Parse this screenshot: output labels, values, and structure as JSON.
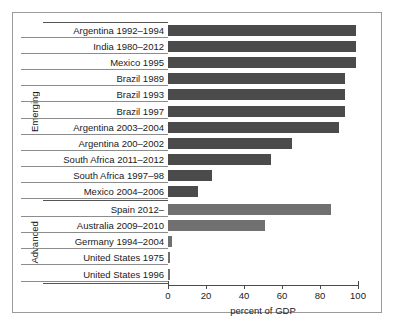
{
  "chart_data": {
    "type": "bar",
    "orientation": "horizontal",
    "title": "",
    "xlabel": "percent of GDP",
    "ylabel": "",
    "xlim": [
      0,
      100
    ],
    "xticks": [
      0,
      20,
      40,
      60,
      80,
      100
    ],
    "xtick_labels": [
      "0",
      "20",
      "40",
      "60",
      "80",
      "100"
    ],
    "grid": false,
    "legend": "none",
    "groups": [
      {
        "name": "Emerging",
        "color": "#4b4b4b",
        "categories": [
          "Argentina 1992–1994",
          "India 1980–2012",
          "Mexico 1995",
          "Brazil 1989",
          "Brazil 1993",
          "Brazil 1997",
          "Argentina 2003–2004",
          "Argentina 200–2002",
          "South Africa 2011–2012",
          "South Africa 1997–98",
          "Mexico 2004–2006"
        ],
        "values": [
          99,
          99,
          99,
          93,
          93,
          93,
          90,
          65,
          54,
          23,
          16
        ]
      },
      {
        "name": "Advanced",
        "color": "#707070",
        "categories": [
          "Spain 2012–",
          "Australia 2009–2010",
          "Germany 1994–2004",
          "United States 1975",
          "United States 1996"
        ],
        "values": [
          86,
          51,
          2,
          1,
          1
        ]
      }
    ]
  },
  "axis": {
    "x_label": "percent of GDP",
    "ticks": [
      "0",
      "20",
      "40",
      "60",
      "80",
      "100"
    ]
  },
  "group_labels": {
    "emerging": "Emerging",
    "advanced": "Advanced"
  }
}
